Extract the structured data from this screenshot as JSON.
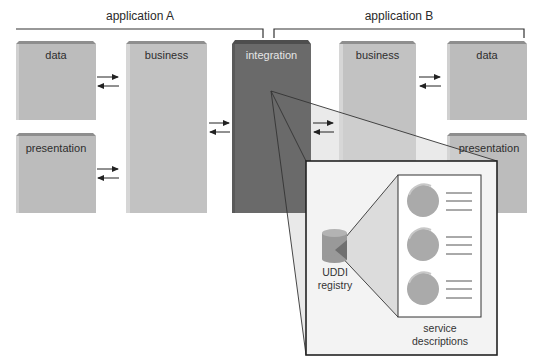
{
  "diagram": {
    "applications": [
      {
        "id": "A",
        "label": "application A"
      },
      {
        "id": "B",
        "label": "application B"
      }
    ],
    "boxes": {
      "data_a": {
        "label": "data"
      },
      "presentation_a": {
        "label": "presentation"
      },
      "business_a": {
        "label": "business"
      },
      "integration": {
        "label": "integration"
      },
      "business_b": {
        "label": "business"
      },
      "data_b": {
        "label": "data"
      },
      "presentation_b": {
        "label": "presentation"
      }
    },
    "zoom_detail": {
      "registry_label_line1": "UDDI",
      "registry_label_line2": "registry",
      "service_label_line1": "service",
      "service_label_line2": "descriptions",
      "service_entries": 3
    },
    "colors": {
      "box_face": "#bdbdbd",
      "box_top": "#8f8f8f",
      "box_side": "#d2d2d2",
      "integration_face": "#6b6b6b",
      "integration_top": "#4f4f4f",
      "cone_fill": "#e8e8e8",
      "circle_fill": "#a9a9a9",
      "stroke": "#222222"
    }
  }
}
